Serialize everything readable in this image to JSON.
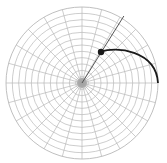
{
  "diagram": {
    "type": "polar-grid",
    "canvas": {
      "width": 167,
      "height": 163
    },
    "center": {
      "x": 82,
      "y": 83
    },
    "outer_radius": 76,
    "ring_count": 12,
    "spoke_count": 24,
    "hub_radius": 5,
    "colors": {
      "background": "#ffffff",
      "grid": "#b8b8b8",
      "hub": "#9a9a9a",
      "highlight": "#1a1a1a"
    },
    "highlight_ray": {
      "angle_deg": 58,
      "from_radius": 0,
      "to_radius": 79
    },
    "marker_point": {
      "x": 101,
      "y": 52,
      "radius": 3.2
    },
    "arc_path": {
      "start": {
        "x": 101,
        "y": 52
      },
      "end": {
        "x": 158,
        "y": 83
      },
      "control_radius": 40
    }
  }
}
